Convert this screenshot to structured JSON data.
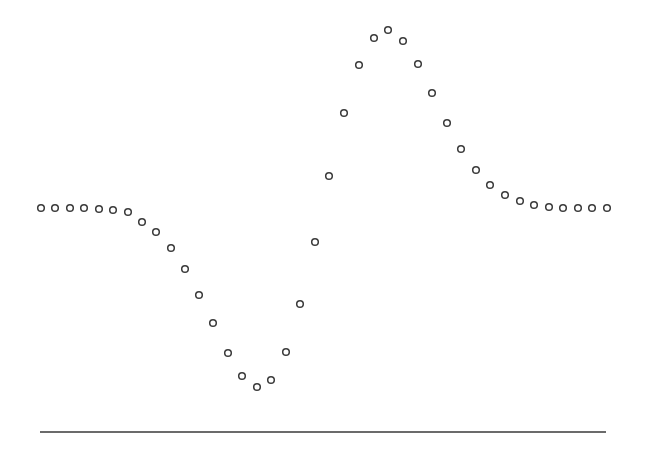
{
  "chart_data": {
    "type": "scatter",
    "title": "",
    "xlabel": "",
    "ylabel": "",
    "grid": false,
    "legend": null,
    "marker": "open-circle",
    "marker_color": "#3a3a3a",
    "axis_color": "#3a3a3a",
    "x": [
      0,
      1,
      2,
      3,
      4,
      5,
      6,
      7,
      8,
      9,
      10,
      11,
      12,
      13,
      14,
      15,
      16,
      17,
      18,
      19,
      20,
      21,
      22,
      23,
      24,
      25,
      26,
      27,
      28,
      29,
      30,
      31,
      32,
      33,
      34,
      35,
      36,
      37,
      38,
      39
    ],
    "y": [
      0.0,
      0.0,
      0.0,
      0.0,
      0.0,
      -0.01,
      -0.02,
      -0.05,
      -0.09,
      -0.15,
      -0.23,
      -0.34,
      -0.47,
      -0.61,
      -0.75,
      -0.88,
      -0.93,
      -0.89,
      -0.75,
      -0.47,
      -0.19,
      0.18,
      0.53,
      0.82,
      0.97,
      1.0,
      0.95,
      0.82,
      0.68,
      0.51,
      0.34,
      0.23,
      0.14,
      0.07,
      0.04,
      0.02,
      0.01,
      0.0,
      0.0,
      0.0
    ],
    "pixel_points": [
      [
        41,
        208
      ],
      [
        55,
        208
      ],
      [
        70,
        208
      ],
      [
        84,
        208
      ],
      [
        99,
        209
      ],
      [
        113,
        210
      ],
      [
        128,
        212
      ],
      [
        142,
        222
      ],
      [
        156,
        232
      ],
      [
        171,
        248
      ],
      [
        185,
        269
      ],
      [
        199,
        295
      ],
      [
        213,
        323
      ],
      [
        228,
        353
      ],
      [
        242,
        376
      ],
      [
        257,
        387
      ],
      [
        271,
        380
      ],
      [
        286,
        352
      ],
      [
        300,
        304
      ],
      [
        315,
        242
      ],
      [
        329,
        176
      ],
      [
        344,
        113
      ],
      [
        359,
        65
      ],
      [
        374,
        38
      ],
      [
        388,
        30
      ],
      [
        403,
        41
      ],
      [
        418,
        64
      ],
      [
        432,
        93
      ],
      [
        447,
        123
      ],
      [
        461,
        149
      ],
      [
        476,
        170
      ],
      [
        490,
        185
      ],
      [
        505,
        195
      ],
      [
        520,
        201
      ],
      [
        534,
        205
      ],
      [
        549,
        207
      ],
      [
        563,
        208
      ],
      [
        578,
        208
      ],
      [
        592,
        208
      ],
      [
        607,
        208
      ]
    ],
    "baseline": {
      "x1": 40,
      "x2": 606,
      "y": 432
    }
  }
}
